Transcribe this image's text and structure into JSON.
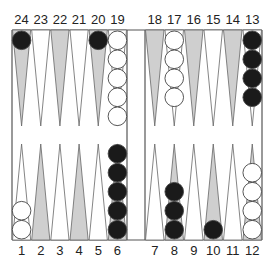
{
  "board": {
    "title": "Backgammon position",
    "colors": {
      "background": "#ffffff",
      "frame": "#555555",
      "point_shaded": "#cfcfcf",
      "point_light": "#ffffff",
      "point_stroke": "#666666",
      "black_checker": "#1a1a1a",
      "white_checker": "#ffffff",
      "checker_stroke": "#444444"
    },
    "top_labels_left": [
      "24",
      "23",
      "22",
      "21",
      "20",
      "19"
    ],
    "top_labels_right": [
      "18",
      "17",
      "16",
      "15",
      "14",
      "13"
    ],
    "bottom_labels_left": [
      "1",
      "2",
      "3",
      "4",
      "5",
      "6"
    ],
    "bottom_labels_right": [
      "7",
      "8",
      "9",
      "10",
      "11",
      "12"
    ],
    "points": [
      {
        "point": 1,
        "shaded": false,
        "checkers": {
          "color": "white",
          "count": 2
        }
      },
      {
        "point": 2,
        "shaded": true,
        "checkers": null
      },
      {
        "point": 3,
        "shaded": false,
        "checkers": null
      },
      {
        "point": 4,
        "shaded": true,
        "checkers": null
      },
      {
        "point": 5,
        "shaded": false,
        "checkers": null
      },
      {
        "point": 6,
        "shaded": true,
        "checkers": {
          "color": "black",
          "count": 5
        }
      },
      {
        "point": 7,
        "shaded": false,
        "checkers": null
      },
      {
        "point": 8,
        "shaded": true,
        "checkers": {
          "color": "black",
          "count": 3
        }
      },
      {
        "point": 9,
        "shaded": false,
        "checkers": null
      },
      {
        "point": 10,
        "shaded": true,
        "checkers": {
          "color": "black",
          "count": 1
        }
      },
      {
        "point": 11,
        "shaded": false,
        "checkers": null
      },
      {
        "point": 12,
        "shaded": true,
        "checkers": {
          "color": "white",
          "count": 4
        }
      },
      {
        "point": 13,
        "shaded": false,
        "checkers": {
          "color": "black",
          "count": 4
        }
      },
      {
        "point": 14,
        "shaded": true,
        "checkers": null
      },
      {
        "point": 15,
        "shaded": false,
        "checkers": null
      },
      {
        "point": 16,
        "shaded": true,
        "checkers": null
      },
      {
        "point": 17,
        "shaded": false,
        "checkers": {
          "color": "white",
          "count": 4
        }
      },
      {
        "point": 18,
        "shaded": true,
        "checkers": null
      },
      {
        "point": 19,
        "shaded": false,
        "checkers": {
          "color": "white",
          "count": 5
        }
      },
      {
        "point": 20,
        "shaded": true,
        "checkers": {
          "color": "black",
          "count": 1
        }
      },
      {
        "point": 21,
        "shaded": false,
        "checkers": null
      },
      {
        "point": 22,
        "shaded": true,
        "checkers": null
      },
      {
        "point": 23,
        "shaded": false,
        "checkers": null
      },
      {
        "point": 24,
        "shaded": true,
        "checkers": {
          "color": "black",
          "count": 1
        }
      }
    ]
  }
}
